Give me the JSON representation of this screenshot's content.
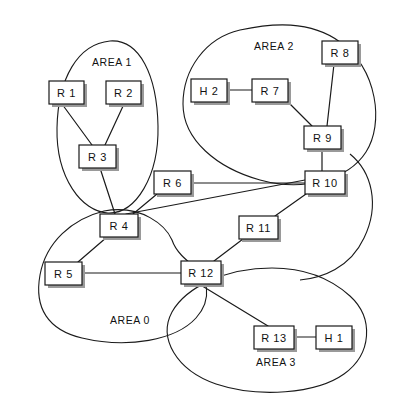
{
  "diagram": {
    "width": 401,
    "height": 403,
    "background_color": "#ffffff",
    "line_color": "#1a1a1a",
    "shadow_color": "#9a9a9a"
  },
  "areas": [
    {
      "id": "area-1",
      "label": "AREA 1",
      "label_x": 112,
      "label_y": 62,
      "path": "M 110 41 C 78 44 58 78 57 128 C 56 178 82 212 108 213 C 136 214 159 176 158 126 C 157 76 140 39 110 41 Z"
    },
    {
      "id": "area-2",
      "label": "AREA 2",
      "label_x": 274,
      "label_y": 46,
      "path": "M 240 30 C 205 38 183 70 183 104 C 183 140 217 168 260 180 C 303 192 348 180 366 152 C 384 124 378 70 340 42 C 310 20 272 23 240 30 Z"
    },
    {
      "id": "area-0",
      "label": "AREA 0",
      "label_x": 130,
      "label_y": 320,
      "path": "M 104 211 C 72 219 46 242 40 275 C 34 308 48 330 82 338 C 128 349 176 340 196 318 C 214 298 206 276 196 268 C 186 260 176 252 172 240 C 166 226 142 204 104 211 Z"
    },
    {
      "id": "area-3",
      "label": "AREA 3",
      "label_x": 276,
      "label_y": 362,
      "path": "M 272 268 C 226 268 186 287 172 312 C 158 338 176 370 216 384 C 258 398 316 394 344 374 C 372 354 374 318 350 296 C 328 276 300 268 272 268 Z"
    }
  ],
  "area_right_curve": {
    "id": "area-0-right-arc",
    "path": "M 350 154 C 372 172 380 205 364 238 C 350 268 322 278 300 280"
  },
  "nodes": [
    {
      "id": "r1",
      "label": "R 1",
      "x": 49,
      "y": 81,
      "w": 35,
      "h": 23
    },
    {
      "id": "r2",
      "label": "R 2",
      "x": 106,
      "y": 81,
      "w": 35,
      "h": 23
    },
    {
      "id": "r3",
      "label": "R 3",
      "x": 79,
      "y": 145,
      "w": 37,
      "h": 23
    },
    {
      "id": "r4",
      "label": "R 4",
      "x": 100,
      "y": 214,
      "w": 38,
      "h": 23
    },
    {
      "id": "r5",
      "label": "R 5",
      "x": 45,
      "y": 262,
      "w": 37,
      "h": 23
    },
    {
      "id": "r6",
      "label": "R 6",
      "x": 154,
      "y": 171,
      "w": 37,
      "h": 23
    },
    {
      "id": "h2",
      "label": "H 2",
      "x": 191,
      "y": 79,
      "w": 36,
      "h": 23
    },
    {
      "id": "r7",
      "label": "R 7",
      "x": 252,
      "y": 79,
      "w": 36,
      "h": 23
    },
    {
      "id": "r8",
      "label": "R 8",
      "x": 322,
      "y": 41,
      "w": 36,
      "h": 23
    },
    {
      "id": "r9",
      "label": "R 9",
      "x": 304,
      "y": 126,
      "w": 37,
      "h": 23
    },
    {
      "id": "r10",
      "label": "R 10",
      "x": 305,
      "y": 171,
      "w": 40,
      "h": 23
    },
    {
      "id": "r11",
      "label": "R 11",
      "x": 239,
      "y": 216,
      "w": 39,
      "h": 23
    },
    {
      "id": "r12",
      "label": "R 12",
      "x": 181,
      "y": 261,
      "w": 40,
      "h": 23
    },
    {
      "id": "r13",
      "label": "R 13",
      "x": 254,
      "y": 326,
      "w": 40,
      "h": 23
    },
    {
      "id": "h1",
      "label": "H 1",
      "x": 316,
      "y": 326,
      "w": 36,
      "h": 23
    }
  ],
  "links": [
    {
      "id": "link-r1-r3",
      "from": "R 1",
      "to": "R 3",
      "x1": 62,
      "y1": 104,
      "x2": 92,
      "y2": 145
    },
    {
      "id": "link-r2-r3",
      "from": "R 2",
      "to": "R 3",
      "x1": 124,
      "y1": 104,
      "x2": 105,
      "y2": 145
    },
    {
      "id": "link-r3-r4",
      "from": "R 3",
      "to": "R 4",
      "x1": 100,
      "y1": 168,
      "x2": 115,
      "y2": 214
    },
    {
      "id": "link-r4-r10",
      "from": "R 4",
      "to": "R 10",
      "x1": 126,
      "y1": 214,
      "x2": 305,
      "y2": 180
    },
    {
      "id": "link-r4-r6",
      "from": "R 4",
      "to": "R 6",
      "x1": 133,
      "y1": 214,
      "x2": 157,
      "y2": 194
    },
    {
      "id": "link-r4-r5",
      "from": "R 4",
      "to": "R 5",
      "x1": 107,
      "y1": 237,
      "x2": 78,
      "y2": 262
    },
    {
      "id": "link-r6-r10",
      "from": "R 6",
      "to": "R 10",
      "x1": 191,
      "y1": 183,
      "x2": 305,
      "y2": 183
    },
    {
      "id": "link-h2-r7",
      "from": "H 2",
      "to": "R 7",
      "x1": 227,
      "y1": 90,
      "x2": 252,
      "y2": 90
    },
    {
      "id": "link-r7-r9",
      "from": "R 7",
      "to": "R 9",
      "x1": 288,
      "y1": 102,
      "x2": 312,
      "y2": 126
    },
    {
      "id": "link-r8-r9",
      "from": "R 8",
      "to": "R 9",
      "x1": 334,
      "y1": 64,
      "x2": 327,
      "y2": 126
    },
    {
      "id": "link-r9-r10",
      "from": "R 9",
      "to": "R 10",
      "x1": 322,
      "y1": 149,
      "x2": 322,
      "y2": 171
    },
    {
      "id": "link-r10-r11",
      "from": "R 10",
      "to": "R 11",
      "x1": 306,
      "y1": 194,
      "x2": 275,
      "y2": 216
    },
    {
      "id": "link-r11-r12",
      "from": "R 11",
      "to": "R 12",
      "x1": 243,
      "y1": 239,
      "x2": 214,
      "y2": 261
    },
    {
      "id": "link-r5-r12",
      "from": "R 5",
      "to": "R 12",
      "x1": 82,
      "y1": 273,
      "x2": 181,
      "y2": 273
    },
    {
      "id": "link-r12-r13",
      "from": "R 12",
      "to": "R 13",
      "x1": 199,
      "y1": 284,
      "x2": 268,
      "y2": 326
    },
    {
      "id": "link-r13-h1",
      "from": "R 13",
      "to": "H 1",
      "x1": 294,
      "y1": 337,
      "x2": 316,
      "y2": 337
    }
  ]
}
